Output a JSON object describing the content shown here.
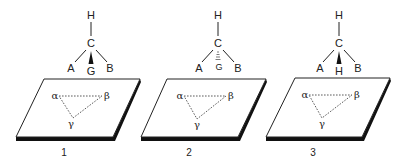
{
  "figure": {
    "panels": [
      {
        "label": "1",
        "molecule": {
          "top": "H",
          "center": "C",
          "left": "A",
          "front": "G",
          "right": "B",
          "front_bond": "wedge"
        },
        "sites": {
          "a": "α",
          "b": "β",
          "c": "γ"
        }
      },
      {
        "label": "2",
        "molecule": {
          "top": "H",
          "center": "C",
          "left": "A",
          "front": "G",
          "right": "B",
          "front_bond": "hashed"
        },
        "sites": {
          "a": "α",
          "b": "β",
          "c": "γ"
        }
      },
      {
        "label": "3",
        "molecule": {
          "top": "H",
          "center": "C",
          "left": "A",
          "front": "H",
          "right": "B",
          "front_bond": "wedge"
        },
        "sites": {
          "a": "α",
          "b": "β",
          "c": "γ"
        }
      }
    ],
    "colors": {
      "line": "#222222",
      "background": "#ffffff",
      "shadow": "#111111"
    }
  }
}
